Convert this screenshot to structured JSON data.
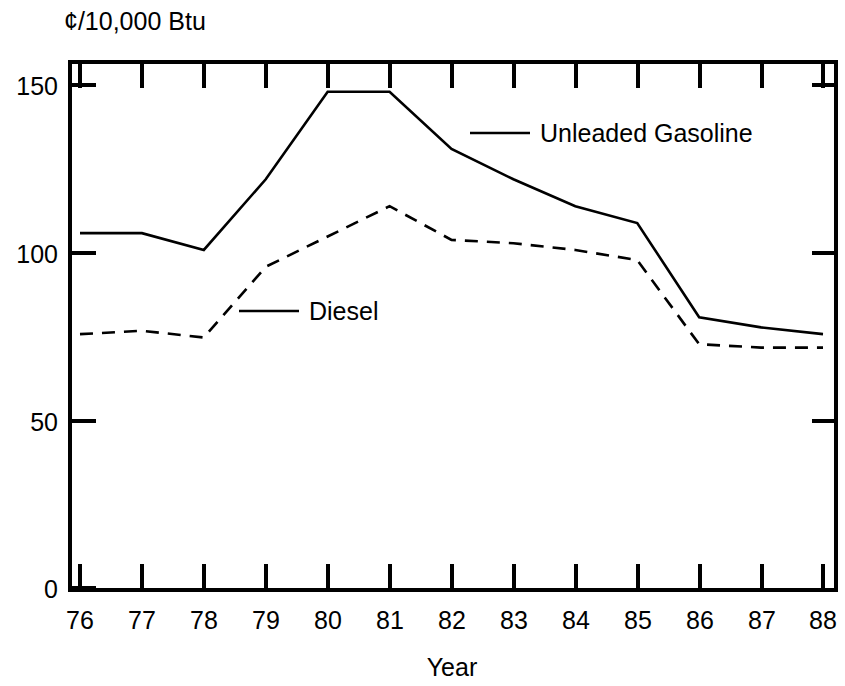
{
  "chart_data": {
    "type": "line",
    "title": "",
    "subtitle": "",
    "xlabel": "Year",
    "ylabel": "¢/10,000 Btu",
    "unit_label": "¢/10,000 Btu",
    "categories": [
      "76",
      "77",
      "78",
      "79",
      "80",
      "81",
      "82",
      "83",
      "84",
      "85",
      "86",
      "87",
      "88"
    ],
    "x": [
      76,
      77,
      78,
      79,
      80,
      81,
      82,
      83,
      84,
      85,
      86,
      87,
      88
    ],
    "xlim": [
      76,
      88
    ],
    "ylim": [
      0,
      150
    ],
    "yticks": [
      0,
      50,
      100,
      150
    ],
    "ytick_labels": [
      "0",
      "50",
      "100",
      "150"
    ],
    "xticks": [
      76,
      77,
      78,
      79,
      80,
      81,
      82,
      83,
      84,
      85,
      86,
      87,
      88
    ],
    "grid": false,
    "legend_position": "inline-annotation",
    "series": [
      {
        "name": "Unleaded Gasoline",
        "style": "solid",
        "color": "#000000",
        "values": [
          106,
          106,
          101,
          122,
          148,
          148,
          131,
          122,
          114,
          109,
          81,
          78,
          76
        ]
      },
      {
        "name": "Diesel",
        "style": "dashed",
        "color": "#000000",
        "values": [
          76,
          77,
          75,
          96,
          105,
          114,
          104,
          103,
          101,
          98,
          73,
          72,
          72
        ]
      }
    ]
  },
  "labels": {
    "unit_label": "¢/10,000 Btu",
    "x_axis_title": "Year",
    "legend_gasoline": "Unleaded Gasoline",
    "legend_diesel": "Diesel",
    "ytick_0": "0",
    "ytick_50": "50",
    "ytick_100": "100",
    "ytick_150": "150",
    "xtick_76": "76",
    "xtick_77": "77",
    "xtick_78": "78",
    "xtick_79": "79",
    "xtick_80": "80",
    "xtick_81": "81",
    "xtick_82": "82",
    "xtick_83": "83",
    "xtick_84": "84",
    "xtick_85": "85",
    "xtick_86": "86",
    "xtick_87": "87",
    "xtick_88": "88"
  }
}
